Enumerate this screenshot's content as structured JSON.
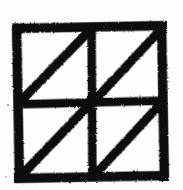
{
  "figure": {
    "title": "Divided square with diagonals",
    "style": "hand-drawn ink on paper, thick rough strokes",
    "background_color": "#fdfdfc",
    "ink_color": "#100d0b",
    "stroke_width_px": 9,
    "diagonal_stroke_width_px": 9,
    "canvas": {
      "width": 183,
      "height": 190
    },
    "geometry": {
      "square": {
        "left": 15,
        "top": 27,
        "right": 166,
        "bottom": 177
      },
      "dividers": {
        "vertical_x": 92,
        "horizontal_y": 103
      },
      "quadrants": [
        {
          "name": "top-left",
          "diagonal_direction": "lower-left-to-upper-right",
          "from": [
            15,
            103
          ],
          "to": [
            92,
            27
          ]
        },
        {
          "name": "top-right",
          "diagonal_direction": "lower-left-to-upper-right",
          "from": [
            92,
            103
          ],
          "to": [
            166,
            27
          ]
        },
        {
          "name": "bottom-left",
          "diagonal_direction": "lower-left-to-upper-right",
          "from": [
            15,
            177
          ],
          "to": [
            92,
            103
          ]
        },
        {
          "name": "bottom-right",
          "diagonal_direction": "lower-left-to-upper-right",
          "from": [
            92,
            177
          ],
          "to": [
            166,
            103
          ]
        }
      ]
    },
    "counts": {
      "quadrants": 4,
      "diagonals": 4,
      "triangles": 8
    }
  }
}
